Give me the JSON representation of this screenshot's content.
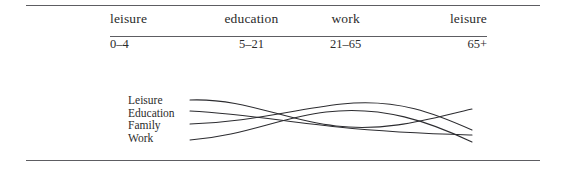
{
  "figure": {
    "type": "life-stage-diagram",
    "rules": {
      "top": "horizontal-rule",
      "header": "horizontal-rule",
      "bottom": "horizontal-rule"
    }
  },
  "stage_table": {
    "columns": [
      {
        "name": "leisure",
        "range": "0–4"
      },
      {
        "name": "education",
        "range": "5–21"
      },
      {
        "name": "work",
        "range": "21–65"
      },
      {
        "name": "leisure",
        "range": "65+"
      }
    ]
  },
  "curve_chart": {
    "legend": [
      {
        "label": "Leisure"
      },
      {
        "label": "Education"
      },
      {
        "label": "Family"
      },
      {
        "label": "Work"
      }
    ],
    "series": [
      {
        "name": "Leisure",
        "path": "M 4 8 C 60 6, 96 28, 150 34 C 204 40, 246 26, 286 17"
      },
      {
        "name": "Education",
        "path": "M 4 19 C 62 22, 100 30, 152 35 C 210 41, 250 42, 286 43"
      },
      {
        "name": "Family",
        "path": "M 4 32 C 64 30, 104 18, 156 12 C 212 6, 250 22, 286 38"
      },
      {
        "name": "Work",
        "path": "M 4 48 C 58 44, 92 26, 140 20 C 196 13, 244 30, 286 50"
      }
    ]
  }
}
